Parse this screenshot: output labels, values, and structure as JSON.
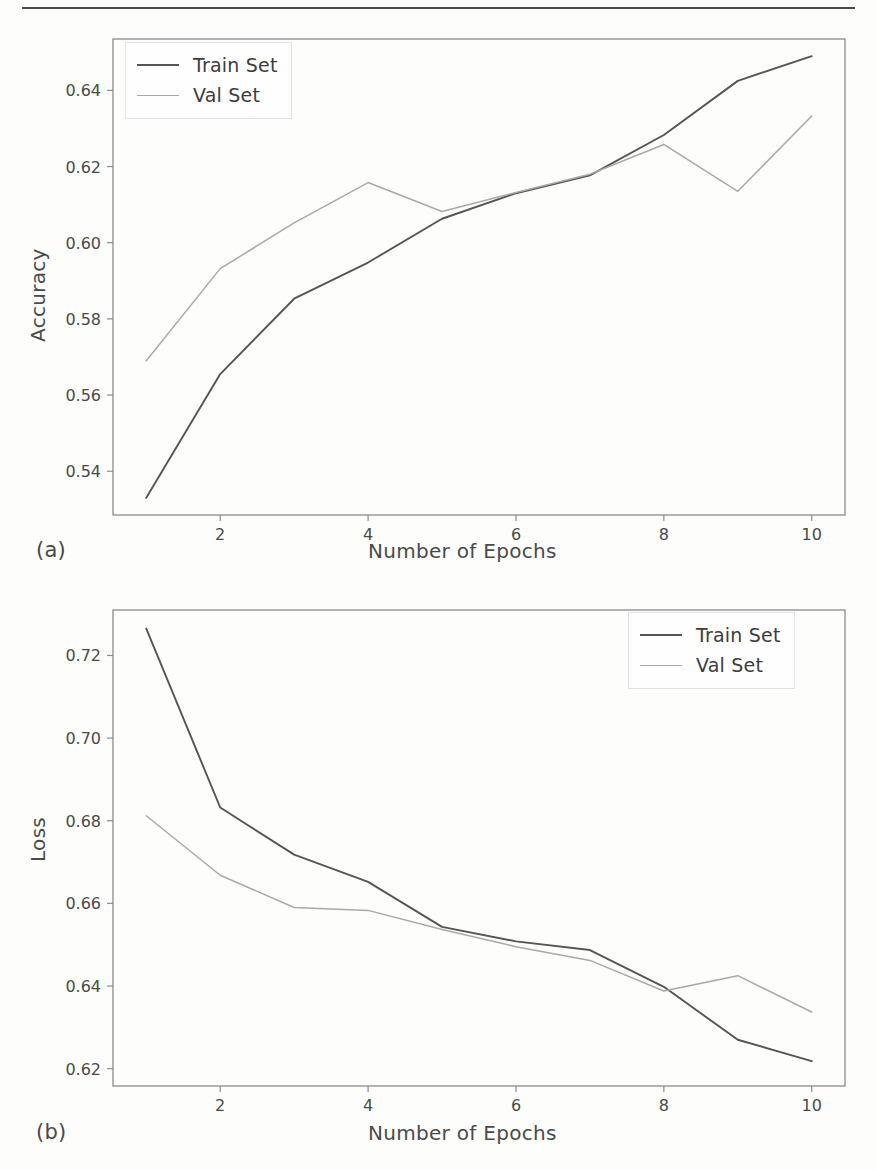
{
  "figure": {
    "top_rule": true,
    "panels": [
      {
        "label": "(a)"
      },
      {
        "label": "(b)"
      }
    ]
  },
  "colors": {
    "train": "#555555",
    "val": "#a9a9a9",
    "axis": "#8c8c8c",
    "text": "#4a4a4a",
    "background": "#fdfdfc"
  },
  "chart_data": [
    {
      "type": "line",
      "panel": "(a)",
      "title": "",
      "xlabel": "Number of Epochs",
      "ylabel": "Accuracy",
      "x": [
        1,
        2,
        3,
        4,
        5,
        6,
        7,
        8,
        9,
        10
      ],
      "xlim": [
        0.55,
        10.45
      ],
      "ylim": [
        0.5285,
        0.6535
      ],
      "xticks": [
        2,
        4,
        6,
        8,
        10
      ],
      "xtick_labels": [
        "2",
        "4",
        "6",
        "8",
        "10"
      ],
      "yticks": [
        0.54,
        0.56,
        0.58,
        0.6,
        0.62,
        0.64
      ],
      "ytick_labels": [
        "0.54",
        "0.56",
        "0.58",
        "0.60",
        "0.62",
        "0.64"
      ],
      "grid": false,
      "legend_position": "upper left",
      "series": [
        {
          "name": "Train Set",
          "color": "#555555",
          "values": [
            0.533,
            0.5655,
            0.5853,
            0.5948,
            0.6063,
            0.613,
            0.6177,
            0.6283,
            0.6425,
            0.649
          ]
        },
        {
          "name": "Val Set",
          "color": "#a9a9a9",
          "values": [
            0.569,
            0.5932,
            0.6052,
            0.6158,
            0.6082,
            0.6132,
            0.618,
            0.6258,
            0.6135,
            0.6333
          ]
        }
      ]
    },
    {
      "type": "line",
      "panel": "(b)",
      "title": "",
      "xlabel": "Number of Epochs",
      "ylabel": "Loss",
      "x": [
        1,
        2,
        3,
        4,
        5,
        6,
        7,
        8,
        9,
        10
      ],
      "xlim": [
        0.55,
        10.45
      ],
      "ylim": [
        0.6158,
        0.731
      ],
      "xticks": [
        2,
        4,
        6,
        8,
        10
      ],
      "xtick_labels": [
        "2",
        "4",
        "6",
        "8",
        "10"
      ],
      "yticks": [
        0.62,
        0.64,
        0.66,
        0.68,
        0.7,
        0.72
      ],
      "ytick_labels": [
        "0.62",
        "0.64",
        "0.66",
        "0.68",
        "0.70",
        "0.72"
      ],
      "grid": false,
      "legend_position": "upper right",
      "series": [
        {
          "name": "Train Set",
          "color": "#555555",
          "values": [
            0.7265,
            0.6832,
            0.6718,
            0.6652,
            0.6543,
            0.6508,
            0.6487,
            0.6398,
            0.627,
            0.6218
          ]
        },
        {
          "name": "Val Set",
          "color": "#a9a9a9",
          "values": [
            0.6812,
            0.6668,
            0.659,
            0.6583,
            0.6537,
            0.6495,
            0.6462,
            0.6388,
            0.6425,
            0.6337
          ]
        }
      ]
    }
  ]
}
